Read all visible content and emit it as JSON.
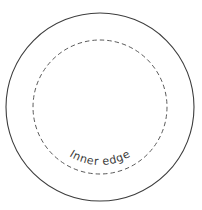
{
  "canvas": {
    "width": 202,
    "height": 210,
    "background_color": "#ffffff"
  },
  "diagram": {
    "center": {
      "x": 100,
      "y": 107
    },
    "shapes": [
      {
        "name": "outer-rim-circle",
        "type": "circle",
        "style": "solid",
        "radius": 94,
        "stroke_color": "#3d3d3d",
        "stroke_width": 1.1,
        "fill": "none"
      },
      {
        "name": "inner-edge-circle",
        "type": "circle",
        "style": "dashed",
        "radius": 67,
        "stroke_color": "#5a5a5a",
        "stroke_width": 1,
        "dash_length": 4.5,
        "dash_gap": 3,
        "fill": "none"
      }
    ]
  },
  "labels": {
    "inner_edge": {
      "text": "Inner edge",
      "color": "#3a3a3a",
      "font_size_px": 11,
      "placement": "curved along bottom of dashed circle",
      "arc_radius": 58,
      "start_offset_percent": "50%"
    }
  }
}
